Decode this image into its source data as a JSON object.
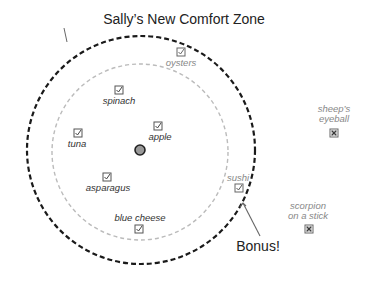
{
  "title": "Sally’s New Comfort Zone",
  "callout": "Bonus!",
  "colors": {
    "outer_circle": "#1a1a1a",
    "inner_circle": "#bbbbbb",
    "center_dot_fill": "#999999",
    "center_dot_stroke": "#222222",
    "arrow": "#666666"
  },
  "zones": {
    "outer": {
      "label": "new comfort zone",
      "cx": 141,
      "cy": 150,
      "r": 114,
      "style": "dashed-black"
    },
    "inner": {
      "label": "original comfort zone",
      "cx": 140,
      "cy": 152,
      "r": 88,
      "style": "dashed-gray"
    },
    "center": {
      "cx": 140,
      "cy": 150,
      "r": 5
    }
  },
  "items": [
    {
      "label": "oysters",
      "status": "checked",
      "zone": "between",
      "x": 181,
      "y": 52,
      "label_position": "below"
    },
    {
      "label": "spinach",
      "status": "checked",
      "zone": "inner",
      "x": 119,
      "y": 90,
      "label_position": "below"
    },
    {
      "label": "apple",
      "status": "checked",
      "zone": "inner",
      "x": 158,
      "y": 126,
      "label_position": "below"
    },
    {
      "label": "tuna",
      "status": "checked",
      "zone": "inner",
      "x": 78,
      "y": 133,
      "label_position": "below"
    },
    {
      "label": "asparagus",
      "status": "checked",
      "zone": "inner",
      "x": 107,
      "y": 177,
      "label_position": "below"
    },
    {
      "label": "blue cheese",
      "status": "checked",
      "zone": "inner",
      "x": 139,
      "y": 229,
      "label_position": "above"
    },
    {
      "label": "sushi",
      "status": "checked",
      "zone": "edge",
      "x": 239,
      "y": 187,
      "label_position": "above"
    },
    {
      "label": "sheep’s\neyeball",
      "line1": "sheep’s",
      "line2": "eyeball",
      "status": "rejected",
      "zone": "outside",
      "x": 334,
      "y": 132,
      "label_position": "above"
    },
    {
      "label": "scorpion\non a stick",
      "line1": "scorpion",
      "line2": "on a stick",
      "status": "rejected",
      "zone": "outside",
      "x": 309,
      "y": 229,
      "label_position": "above"
    }
  ]
}
